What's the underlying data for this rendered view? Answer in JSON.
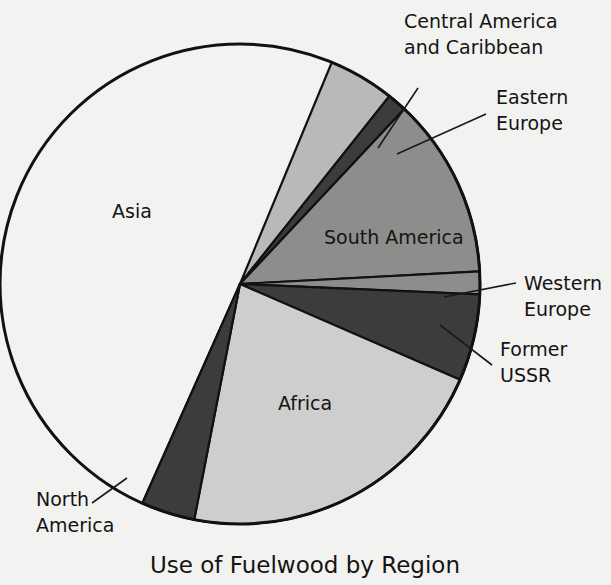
{
  "background_color": "#f2f2f0",
  "title": "Use of Fuelwood by Region",
  "geometry": {
    "center_x": 240,
    "center_y": 284,
    "radius": 240
  },
  "chart_data": {
    "type": "pie",
    "title": "Use of Fuelwood by Region",
    "xlabel": "",
    "ylabel": "",
    "legend_position": "none",
    "labels_placement": "in-slice and callout",
    "categories": [
      "Asia",
      "Central America and Caribbean",
      "Eastern Europe",
      "South America",
      "Western Europe",
      "Former USSR",
      "Africa",
      "North America"
    ],
    "values": [
      46.0,
      4.5,
      1.3,
      13.0,
      1.6,
      5.8,
      23.0,
      4.8
    ],
    "units": "percent of total fuelwood use",
    "slices": [
      {
        "name": "Asia",
        "label": "Asia",
        "value": 46.0,
        "start_angle_deg": 246.0,
        "end_angle_deg": 411.5,
        "color": "#fafaf8",
        "label_placement": "inside",
        "label_x": 112,
        "label_y": 218
      },
      {
        "name": "Central America and Caribbean",
        "label": "Central America and Caribbean",
        "value": 4.5,
        "start_angle_deg": 51.5,
        "end_angle_deg": 67.5,
        "color": "#b9b9b7",
        "label_placement": "callout",
        "label_x": 404,
        "label_y": 28,
        "label_line2_y": 54,
        "leader": [
          [
            378,
            148
          ],
          [
            418,
            88
          ]
        ]
      },
      {
        "name": "Eastern Europe",
        "label": "Eastern Europe",
        "value": 1.3,
        "start_angle_deg": 46.8,
        "end_angle_deg": 51.5,
        "color": "#3c3c3c",
        "label_placement": "callout",
        "label_x": 496,
        "label_y": 104,
        "label_line2_y": 130,
        "leader": [
          [
            397,
            154
          ],
          [
            486,
            114
          ]
        ]
      },
      {
        "name": "South America",
        "label": "South America",
        "value": 13.0,
        "start_angle_deg": 3.0,
        "end_angle_deg": 46.8,
        "color": "#8d8d8b",
        "label_placement": "inside",
        "label_x": 324,
        "label_y": 244
      },
      {
        "name": "Western Europe",
        "label": "Western Europe",
        "value": 1.6,
        "start_angle_deg": -2.5,
        "end_angle_deg": 3.0,
        "color": "#8d8d8b",
        "label_placement": "callout",
        "label_x": 524,
        "label_y": 290,
        "label_line2_y": 316,
        "leader": [
          [
            444,
            297
          ],
          [
            516,
            283
          ]
        ]
      },
      {
        "name": "Former USSR",
        "label": "Former USSR",
        "value": 5.8,
        "start_angle_deg": -23.5,
        "end_angle_deg": -2.5,
        "color": "#3c3c3c",
        "label_placement": "callout",
        "label_x": 500,
        "label_y": 356,
        "label_line2_y": 382,
        "leader": [
          [
            440,
            325
          ],
          [
            492,
            365
          ]
        ]
      },
      {
        "name": "Africa",
        "label": "Africa",
        "value": 23.0,
        "start_angle_deg": -101.0,
        "end_angle_deg": -23.5,
        "color": "#cececc",
        "label_placement": "inside",
        "label_x": 278,
        "label_y": 410
      },
      {
        "name": "North America",
        "label": "North America",
        "value": 4.8,
        "start_angle_deg": -114.0,
        "end_angle_deg": -101.0,
        "color": "#3c3c3c",
        "label_placement": "callout",
        "label_x": 36,
        "label_y": 506,
        "label_line2_y": 532,
        "leader": [
          [
            127,
            478
          ],
          [
            92,
            503
          ]
        ]
      }
    ]
  },
  "colors": {
    "outline": "#111111",
    "text": "#141414",
    "asia": "#fafaf8",
    "central_america": "#b9b9b7",
    "eastern_europe": "#3c3c3c",
    "south_america": "#8d8d8b",
    "western_europe": "#8d8d8b",
    "former_ussr": "#3c3c3c",
    "africa": "#cececc",
    "north_america": "#3c3c3c"
  },
  "labels": {
    "asia": "Asia",
    "central_america_line1": "Central America",
    "central_america_line2": "and Caribbean",
    "eastern_europe_line1": "Eastern",
    "eastern_europe_line2": "Europe",
    "south_america": "South America",
    "western_europe_line1": "Western",
    "western_europe_line2": "Europe",
    "former_ussr_line1": "Former",
    "former_ussr_line2": "USSR",
    "africa": "Africa",
    "north_america_line1": "North",
    "north_america_line2": "America"
  }
}
